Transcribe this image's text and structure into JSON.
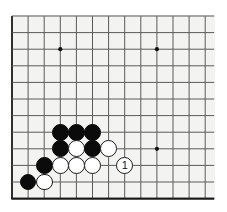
{
  "diagram": {
    "type": "go-board",
    "board": {
      "columns": 13,
      "rows": 12,
      "origin_x": 12,
      "origin_y": 16,
      "spacing_x": 16.1,
      "spacing_y": 16.6,
      "line_color": "#5a5a5a",
      "border_color": "#1a1a1a",
      "surface_color": "#f3f3f1",
      "line_width": 1,
      "border_width": 1.8
    },
    "star_points": [
      {
        "col": 3,
        "row": 2
      },
      {
        "col": 9,
        "row": 2
      },
      {
        "col": 9,
        "row": 8
      }
    ],
    "star_point_radius": 2.1,
    "stone_radius": 8.4,
    "stones": [
      {
        "color": "black",
        "col": 3,
        "row": 7,
        "label": ""
      },
      {
        "color": "black",
        "col": 4,
        "row": 7,
        "label": ""
      },
      {
        "color": "black",
        "col": 5,
        "row": 7,
        "label": ""
      },
      {
        "color": "black",
        "col": 3,
        "row": 8,
        "label": ""
      },
      {
        "color": "white",
        "col": 4,
        "row": 8,
        "label": ""
      },
      {
        "color": "black",
        "col": 5,
        "row": 8,
        "label": ""
      },
      {
        "color": "white",
        "col": 6,
        "row": 8,
        "label": ""
      },
      {
        "color": "black",
        "col": 2,
        "row": 9,
        "label": ""
      },
      {
        "color": "white",
        "col": 3,
        "row": 9,
        "label": ""
      },
      {
        "color": "white",
        "col": 4,
        "row": 9,
        "label": ""
      },
      {
        "color": "white",
        "col": 5,
        "row": 9,
        "label": ""
      },
      {
        "color": "white",
        "col": 7,
        "row": 9,
        "label": "1"
      },
      {
        "color": "black",
        "col": 1,
        "row": 10,
        "label": ""
      },
      {
        "color": "white",
        "col": 2,
        "row": 10,
        "label": ""
      }
    ]
  }
}
